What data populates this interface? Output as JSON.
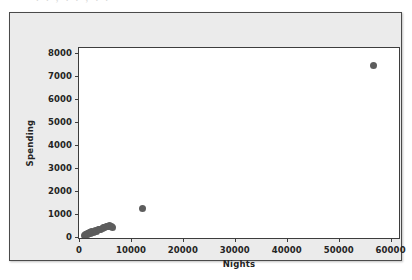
{
  "artifact": {
    "clipped_top_text": ". .            , .        .    ,    .           ."
  },
  "chart_data": {
    "type": "scatter",
    "title": "",
    "xlabel": "Nights",
    "ylabel": "Spending",
    "xlim": [
      0,
      62000
    ],
    "ylim": [
      -150,
      8200
    ],
    "xticks": [
      0,
      10000,
      20000,
      30000,
      40000,
      50000,
      60000
    ],
    "xtick_labels": [
      "0",
      "10000",
      "20000",
      "30000",
      "40000",
      "50000",
      "60000"
    ],
    "yticks": [
      0,
      1000,
      2000,
      3000,
      4000,
      5000,
      6000,
      7000,
      8000
    ],
    "ytick_labels": [
      "0",
      "1000",
      "2000",
      "3000",
      "4000",
      "5000",
      "6000",
      "7000",
      "8000"
    ],
    "grid": false,
    "legend": false,
    "marker_color": "#5d5d5d",
    "marker_size": 7,
    "plot_bg": "#ffffff",
    "panel_bg": "#ebebeb",
    "axis_color": "#3d3d3d",
    "points": [
      {
        "x": 1050,
        "y": 60
      },
      {
        "x": 1250,
        "y": 95
      },
      {
        "x": 1400,
        "y": 110
      },
      {
        "x": 1550,
        "y": 75
      },
      {
        "x": 1700,
        "y": 140
      },
      {
        "x": 1850,
        "y": 120
      },
      {
        "x": 2000,
        "y": 165
      },
      {
        "x": 2150,
        "y": 130
      },
      {
        "x": 2300,
        "y": 185
      },
      {
        "x": 2500,
        "y": 205
      },
      {
        "x": 2700,
        "y": 175
      },
      {
        "x": 2950,
        "y": 230
      },
      {
        "x": 3200,
        "y": 250
      },
      {
        "x": 3450,
        "y": 225
      },
      {
        "x": 3700,
        "y": 290
      },
      {
        "x": 3950,
        "y": 315
      },
      {
        "x": 4200,
        "y": 300
      },
      {
        "x": 4450,
        "y": 360
      },
      {
        "x": 4700,
        "y": 395
      },
      {
        "x": 4950,
        "y": 380
      },
      {
        "x": 5200,
        "y": 430
      },
      {
        "x": 5450,
        "y": 455
      },
      {
        "x": 5700,
        "y": 420
      },
      {
        "x": 5950,
        "y": 470
      },
      {
        "x": 6200,
        "y": 445
      },
      {
        "x": 6450,
        "y": 410
      },
      {
        "x": 12200,
        "y": 1230
      },
      {
        "x": 56800,
        "y": 7420
      }
    ]
  }
}
